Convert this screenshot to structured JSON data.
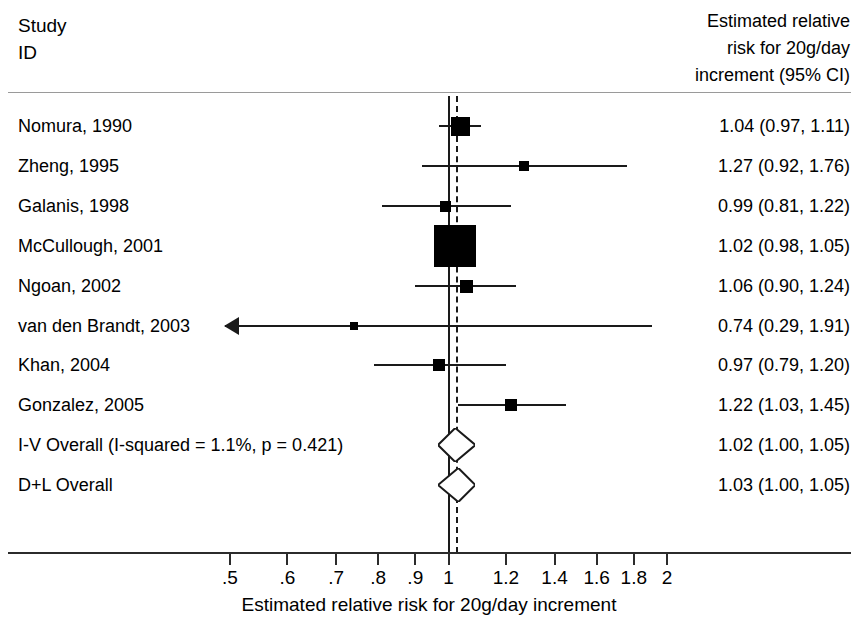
{
  "header": {
    "study_column": "Study\nID",
    "estimate_column": "Estimated relative\nrisk for 20g/day\nincrement (95% CI)"
  },
  "axis": {
    "title": "Estimated relative risk for 20g/day increment",
    "tick_labels": [
      ".5",
      ".6",
      ".7",
      ".8",
      ".9",
      "1",
      "1.2",
      "1.4",
      "1.6",
      "1.8",
      "2"
    ],
    "tick_values": [
      0.5,
      0.6,
      0.7,
      0.8,
      0.9,
      1.0,
      1.2,
      1.4,
      1.6,
      1.8,
      2.0
    ],
    "scale": "log",
    "null_value": "1",
    "pooled_reference": "1.02"
  },
  "rows": [
    {
      "label": "Nomura, 1990",
      "estimate": "1.04 (0.97, 1.11)"
    },
    {
      "label": "Zheng, 1995",
      "estimate": "1.27 (0.92, 1.76)"
    },
    {
      "label": "Galanis, 1998",
      "estimate": "0.99 (0.81, 1.22)"
    },
    {
      "label": "McCullough, 2001",
      "estimate": "1.02 (0.98, 1.05)"
    },
    {
      "label": "Ngoan, 2002",
      "estimate": "1.06 (0.90, 1.24)"
    },
    {
      "label": "van den Brandt, 2003",
      "estimate": "0.74 (0.29, 1.91)"
    },
    {
      "label": "Khan, 2004",
      "estimate": "0.97 (0.79, 1.20)"
    },
    {
      "label": "Gonzalez, 2005",
      "estimate": "1.22 (1.03, 1.45)"
    },
    {
      "label": "I-V Overall  (I-squared = 1.1%, p = 0.421)",
      "estimate": "1.02 (1.00, 1.05)"
    },
    {
      "label": "D+L Overall",
      "estimate": "1.03 (1.00, 1.05)"
    }
  ],
  "chart_data": {
    "type": "forest",
    "title": "",
    "xlabel": "Estimated relative risk for 20g/day increment",
    "ylabel": "",
    "xscale": "log",
    "xlim": [
      0.5,
      2.0
    ],
    "xticks": [
      0.5,
      0.6,
      0.7,
      0.8,
      0.9,
      1.0,
      1.2,
      1.4,
      1.6,
      1.8,
      2.0
    ],
    "xticklabels": [
      ".5",
      ".6",
      ".7",
      ".8",
      ".9",
      "1",
      "1.2",
      "1.4",
      "1.6",
      "1.8",
      "2"
    ],
    "grid": false,
    "null_line": 1.0,
    "pooled_line": 1.02,
    "studies": [
      {
        "name": "Nomura, 1990",
        "estimate": 1.04,
        "ci_low": 0.97,
        "ci_high": 1.11,
        "weight": 0.28,
        "marker": "box",
        "clipped_left": false
      },
      {
        "name": "Zheng, 1995",
        "estimate": 1.27,
        "ci_low": 0.92,
        "ci_high": 1.76,
        "weight": 0.05,
        "marker": "box",
        "clipped_left": false
      },
      {
        "name": "Galanis, 1998",
        "estimate": 0.99,
        "ci_low": 0.81,
        "ci_high": 1.22,
        "weight": 0.08,
        "marker": "box",
        "clipped_left": false
      },
      {
        "name": "McCullough, 2001",
        "estimate": 1.02,
        "ci_low": 0.98,
        "ci_high": 1.05,
        "weight": 1.0,
        "marker": "box",
        "clipped_left": false
      },
      {
        "name": "Ngoan, 2002",
        "estimate": 1.06,
        "ci_low": 0.9,
        "ci_high": 1.24,
        "weight": 0.12,
        "marker": "box",
        "clipped_left": false
      },
      {
        "name": "van den Brandt, 2003",
        "estimate": 0.74,
        "ci_low": 0.29,
        "ci_high": 1.91,
        "weight": 0.02,
        "marker": "box",
        "clipped_left": true
      },
      {
        "name": "Khan, 2004",
        "estimate": 0.97,
        "ci_low": 0.79,
        "ci_high": 1.2,
        "weight": 0.1,
        "marker": "box",
        "clipped_left": false
      },
      {
        "name": "Gonzalez, 2005",
        "estimate": 1.22,
        "ci_low": 1.03,
        "ci_high": 1.45,
        "weight": 0.1,
        "marker": "box",
        "clipped_left": false
      }
    ],
    "summaries": [
      {
        "name": "I-V Overall  (I-squared = 1.1%, p = 0.421)",
        "estimate": 1.02,
        "ci_low": 1.0,
        "ci_high": 1.05,
        "marker": "diamond"
      },
      {
        "name": "D+L Overall",
        "estimate": 1.03,
        "ci_low": 1.0,
        "ci_high": 1.05,
        "marker": "diamond"
      }
    ],
    "heterogeneity": {
      "i_squared": "1.1%",
      "p": "0.421"
    }
  }
}
